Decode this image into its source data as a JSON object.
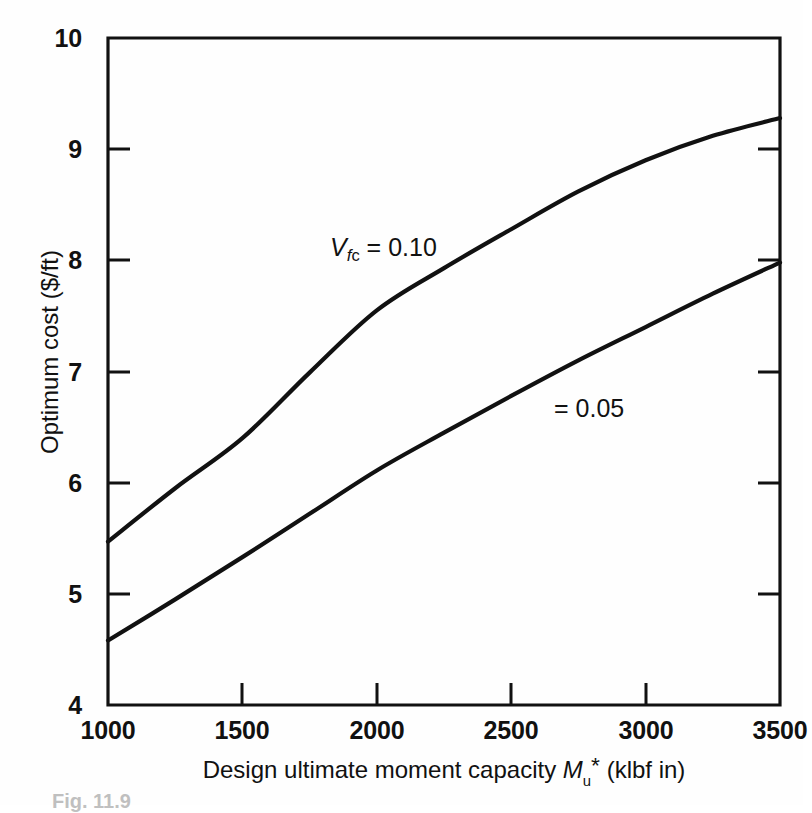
{
  "figure": {
    "caption": "Fig. 11.9"
  },
  "axes": {
    "y": {
      "title_prefix": "Optimum cost (",
      "title_unit": "$/ft",
      "title_suffix": ")",
      "title_full": "Optimum cost ($/ft)",
      "ticks": [
        "10",
        "9",
        "8",
        "7",
        "6",
        "5",
        "4"
      ],
      "min": 4,
      "max": 10
    },
    "x": {
      "title_lead": "Design ultimate moment capacity ",
      "title_symbol": "M",
      "title_symbol_sub": "u",
      "title_symbol_star": "*",
      "title_units": " (klbf in)",
      "title_full": "Design ultimate moment capacity Mu* (klbf in)",
      "ticks": [
        "1000",
        "1500",
        "2000",
        "2500",
        "3000",
        "3500"
      ],
      "min": 1000,
      "max": 3500
    }
  },
  "annotations": {
    "upper": {
      "symbol": "V",
      "symbol_sub": "f",
      "symbol_sub_sub": "c",
      "equals": " = 0.10",
      "text_full": "Vfc = 0.10"
    },
    "lower": {
      "text_full": "= 0.05"
    }
  },
  "colors": {
    "ink": "#111111",
    "background": "#fefefe"
  },
  "chart_data": {
    "type": "line",
    "title": "",
    "xlabel": "Design ultimate moment capacity Mu* (klbf in)",
    "ylabel": "Optimum cost ($/ft)",
    "xlim": [
      1000,
      3500
    ],
    "ylim": [
      4,
      10
    ],
    "grid": false,
    "legend": "inline-annotations",
    "xticks": [
      1000,
      1500,
      2000,
      2500,
      3000,
      3500
    ],
    "yticks": [
      4,
      5,
      6,
      7,
      8,
      9,
      10
    ],
    "x": [
      1000,
      1250,
      1500,
      1750,
      2000,
      2250,
      2500,
      2750,
      3000,
      3250,
      3500
    ],
    "series": [
      {
        "name": "Vfc = 0.10",
        "label": "Vfc = 0.10",
        "values": [
          5.47,
          5.95,
          6.4,
          6.99,
          7.55,
          7.93,
          8.28,
          8.62,
          8.9,
          9.12,
          9.28
        ]
      },
      {
        "name": "Vfc = 0.05",
        "label": "= 0.05",
        "values": [
          4.58,
          4.95,
          5.33,
          5.72,
          6.11,
          6.45,
          6.78,
          7.1,
          7.4,
          7.7,
          7.98
        ]
      }
    ]
  }
}
